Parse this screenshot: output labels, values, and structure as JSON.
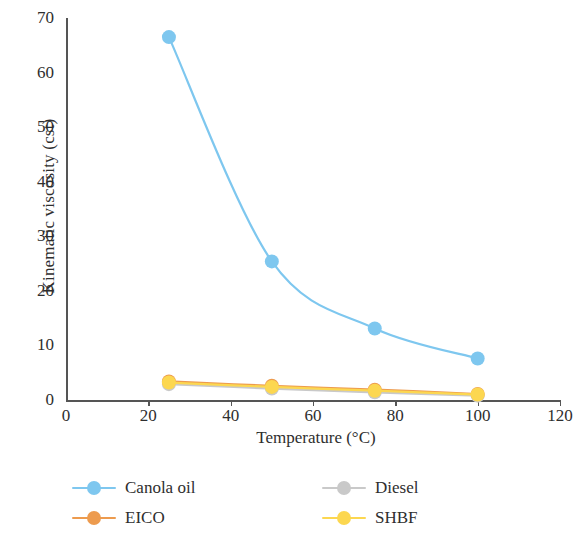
{
  "chart_data": {
    "type": "line",
    "title": "",
    "xlabel": "Temperature (°C)",
    "ylabel": "Kinematic viscosity (cst)",
    "xlim": [
      0,
      120
    ],
    "ylim": [
      0,
      70
    ],
    "xticks": [
      0,
      20,
      40,
      60,
      80,
      100,
      120
    ],
    "yticks": [
      0,
      10,
      20,
      30,
      40,
      50,
      60,
      70
    ],
    "xtick_labels": [
      "0",
      "20",
      "40",
      "60",
      "80",
      "100",
      "120"
    ],
    "ytick_labels": [
      "0",
      "10",
      "20",
      "30",
      "40",
      "50",
      "60",
      "70"
    ],
    "grid": false,
    "legend_position": "bottom",
    "x": [
      25,
      50,
      75,
      100
    ],
    "series": [
      {
        "name": "Canola oil",
        "color": "#7ec7ef",
        "values": [
          66.5,
          25.4,
          13.1,
          7.6
        ]
      },
      {
        "name": "Diesel",
        "color": "#c9c9c9",
        "values": [
          2.9,
          2.1,
          1.4,
          0.8
        ]
      },
      {
        "name": "EICO",
        "color": "#ed9b4e",
        "values": [
          3.4,
          2.6,
          1.9,
          1.1
        ]
      },
      {
        "name": "SHBF",
        "color": "#fcd750",
        "values": [
          3.2,
          2.4,
          1.7,
          1.0
        ]
      }
    ]
  },
  "axes": {
    "y_title": "Kinematic viscosity (cst)",
    "x_title": "Temperature (°C)",
    "y_labels": [
      "70",
      "60",
      "50",
      "40",
      "30",
      "20",
      "10",
      "0"
    ],
    "x_labels": [
      "0",
      "20",
      "40",
      "60",
      "80",
      "100",
      "120"
    ]
  },
  "legend": {
    "items": [
      {
        "label": "Canola oil",
        "color": "#7ec7ef"
      },
      {
        "label": "Diesel",
        "color": "#c9c9c9"
      },
      {
        "label": "EICO",
        "color": "#ed9b4e"
      },
      {
        "label": "SHBF",
        "color": "#fcd750"
      }
    ]
  }
}
